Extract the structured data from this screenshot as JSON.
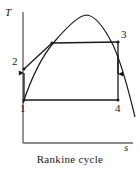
{
  "figure": {
    "caption": "Rankine cycle",
    "axes": {
      "y_label": "T",
      "x_label": "s",
      "y_axis_x": 23,
      "x_axis_y": 143,
      "origin": [
        23,
        143
      ],
      "x_axis_end": [
        133,
        143
      ],
      "y_axis_top": [
        23,
        12
      ]
    },
    "state_points": [
      {
        "id": "1",
        "label": "1",
        "x": 24,
        "y": 100
      },
      {
        "id": "2",
        "label": "2",
        "x": 24,
        "y": 69
      },
      {
        "id": "3",
        "label": "3",
        "x": 118,
        "y": 42
      },
      {
        "id": "4",
        "label": "4",
        "x": 118,
        "y": 100
      }
    ],
    "processes": [
      {
        "name": "pump-1-to-2",
        "from": "1",
        "to": "2",
        "kind": "vertical",
        "arrow": true
      },
      {
        "name": "boiler-2-to-3",
        "from": "2",
        "to": "3",
        "kind": "compound",
        "arrow": false
      },
      {
        "name": "turbine-3-to-4",
        "from": "3",
        "to": "4",
        "kind": "vertical",
        "arrow": true
      },
      {
        "name": "condenser-4-to-1",
        "from": "4",
        "to": "1",
        "kind": "horizontal",
        "arrow": false
      }
    ],
    "saturation_dome": {
      "name": "vapor-dome",
      "apex": [
        85,
        15
      ],
      "left_end": [
        23,
        103
      ],
      "right_end": [
        135,
        117
      ],
      "left_knee": [
        52,
        43
      ]
    },
    "colors": {
      "line": "#1a1a1a",
      "axis": "#555555",
      "background": "#ffffff"
    }
  }
}
